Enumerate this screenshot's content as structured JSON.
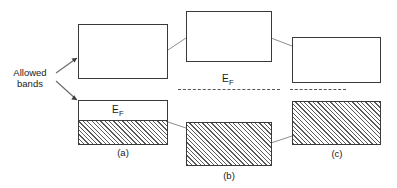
{
  "figure": {
    "title_text": "",
    "annotation": {
      "line1": "Allowed",
      "line2": "bands",
      "icon": "arrow-pointer"
    },
    "fermi_label_text": "E",
    "fermi_label_sub": "F",
    "panels": [
      {
        "id": "a",
        "label": "(a)",
        "fill_percent": 50
      },
      {
        "id": "b",
        "label": "(b)",
        "fill_percent": 100
      },
      {
        "id": "c",
        "label": "(c)",
        "fill_percent": 100
      }
    ],
    "colors": {
      "box_border": "#3a3a3a",
      "hatch": "#5a5a5a",
      "background": "#ffffff",
      "text": "#1a1a1a",
      "dash_line": "#555555",
      "connector": "#777777"
    }
  }
}
